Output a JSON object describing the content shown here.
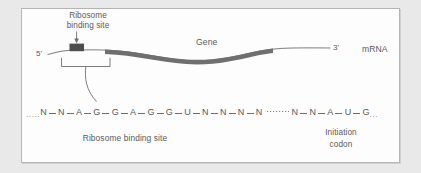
{
  "figure": {
    "kind": "ribosome-binding-site-diagram",
    "molecule_label": "mRNA",
    "five_prime_label": "5'",
    "three_prime_label": "3'",
    "gene_label": "Gene",
    "top_callout": {
      "line1": "Ribosome",
      "line2": "binding site"
    },
    "bottom_callout": "Ribosome binding site",
    "initiation_callout": {
      "line1": "Initiation",
      "line2": "codon"
    },
    "sequence": {
      "leading_ellipsis": ".....",
      "trailing_ellipsis": "...",
      "bases_left": [
        "N",
        "N",
        "A",
        "G",
        "G",
        "A",
        "G",
        "G",
        "U",
        "N",
        "N",
        "N",
        "N"
      ],
      "bases_right": [
        "N",
        "N",
        "A",
        "U",
        "G"
      ]
    },
    "colors": {
      "panel_background": "#fdfdfd",
      "panel_border": "#b4b4b4",
      "page_background": "#e9e9e9",
      "text": "#59595b",
      "strand_line": "#6e6e70",
      "gene_bar": "#6f6f71",
      "rbs_box": "#4d4d4f"
    }
  }
}
